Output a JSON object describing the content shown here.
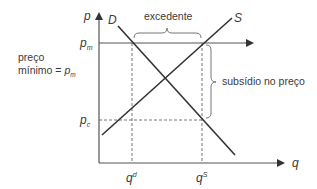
{
  "diagram": {
    "title": "",
    "axes": {
      "y_label": "p",
      "x_label": "q"
    },
    "curves": {
      "demand_label": "D",
      "supply_label": "S"
    },
    "price_levels": {
      "pm_main": "p",
      "pm_sub": "m",
      "pc_main": "p",
      "pc_sub": "c"
    },
    "quantities": {
      "qd_main": "q",
      "qd_sup": "d",
      "qs_main": "q",
      "qs_sup": "S"
    },
    "annotations": {
      "min_price_line1": "preço",
      "min_price_line2": "mínimo = ",
      "min_price_symbol": "p",
      "min_price_sub": "m",
      "surplus": "excedente",
      "price_subsidy": "subsídio no preço"
    },
    "colors": {
      "axis": "#555555",
      "curve": "#333333",
      "dashed": "#666666",
      "brace": "#777777",
      "text": "#3a3a3a"
    }
  }
}
